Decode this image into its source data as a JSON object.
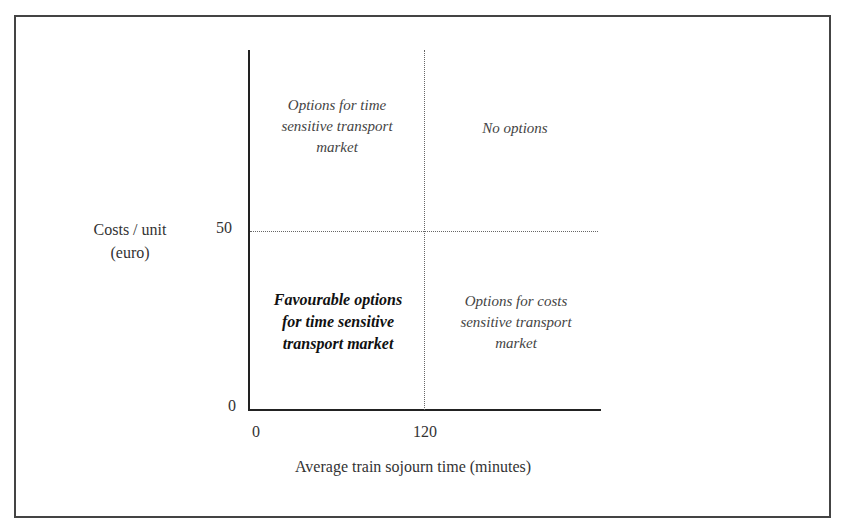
{
  "diagram": {
    "type": "quadrant",
    "y_axis": {
      "label_line1": "Costs / unit",
      "label_line2": "(euro)",
      "ticks": [
        "0",
        "50"
      ],
      "threshold": 50
    },
    "x_axis": {
      "label": "Average train sojourn time  (minutes)",
      "ticks": [
        "0",
        "120"
      ],
      "threshold": 120
    },
    "quadrants": {
      "top_left": {
        "line1": "Options for time",
        "line2": "sensitive transport",
        "line3": "market"
      },
      "top_right": {
        "line1": "No options"
      },
      "bottom_left": {
        "line1": "Favourable options",
        "line2": "for time sensitive",
        "line3": "transport market",
        "emphasis": "bold-italic"
      },
      "bottom_right": {
        "line1": "Options for costs",
        "line2": "sensitive transport",
        "line3": "market"
      }
    }
  }
}
